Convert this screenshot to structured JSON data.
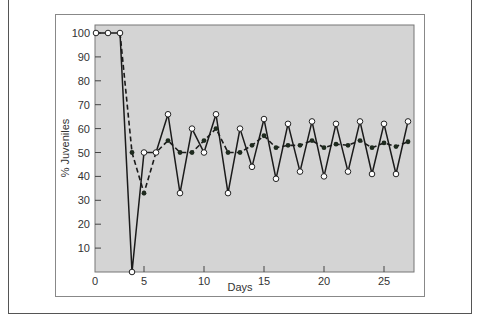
{
  "chart_data": {
    "type": "line",
    "title": "",
    "xlabel": "Days",
    "ylabel": "% Juveniles",
    "xlim": [
      0,
      27.5
    ],
    "ylim": [
      0,
      103
    ],
    "x_ticks": [
      0,
      5,
      10,
      15,
      20,
      25
    ],
    "y_ticks": [
      10,
      20,
      30,
      40,
      50,
      60,
      70,
      80,
      90,
      100
    ],
    "grid": false,
    "background": "#d4d4d4",
    "legend": null,
    "series": [
      {
        "name": "daily (open circles, solid line)",
        "style": "solid",
        "marker": "open-circle",
        "x": [
          1,
          2,
          3,
          4,
          5,
          6,
          7,
          8,
          9,
          10,
          11,
          12,
          13,
          14,
          15,
          16,
          17,
          18,
          19,
          20,
          21,
          22,
          23,
          24,
          25,
          26,
          27
        ],
        "values": [
          100,
          100,
          100,
          0,
          50,
          50,
          66,
          33,
          60,
          50,
          66,
          33,
          60,
          44,
          64,
          39,
          62,
          42,
          63,
          40,
          62,
          42,
          63,
          41,
          62,
          41,
          63
        ]
      },
      {
        "name": "running average (filled dots, dashed line)",
        "style": "dashed",
        "marker": "filled-dot",
        "x": [
          3,
          4,
          5,
          6,
          7,
          8,
          9,
          10,
          11,
          12,
          13,
          14,
          15,
          16,
          17,
          18,
          19,
          20,
          21,
          22,
          23,
          24,
          25,
          26,
          27
        ],
        "values": [
          100,
          50,
          33,
          50,
          55,
          50,
          50,
          55,
          60,
          50,
          50,
          53,
          57,
          52,
          53,
          53,
          55,
          52,
          53.5,
          53,
          55,
          52,
          54,
          52.5,
          54.5
        ]
      }
    ]
  }
}
